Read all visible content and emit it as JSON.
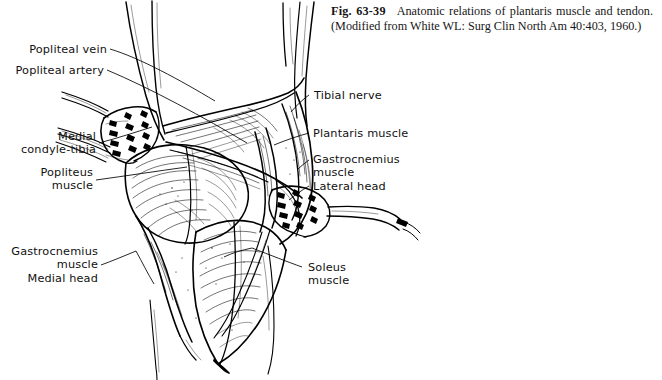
{
  "figure": {
    "number": "Fig. 63-39",
    "caption_text": "Anatomic relations of plantaris muscle and tendon. (Modified from White WL: Surg Clin North Am 40:403, 1960.)"
  },
  "labels": {
    "popliteal_vein": "Popliteal vein",
    "popliteal_artery": "Popliteal artery",
    "medial_condyle_tibia": "Medial\ncondyle-tibia",
    "popliteus_muscle": "Popliteus\nmuscle",
    "gastrocnemius_medial_head": "Gastrocnemius\nmuscle\nMedial head",
    "tibial_nerve": "Tibial nerve",
    "plantaris_muscle": "Plantaris muscle",
    "gastrocnemius_lateral_head": "Gastrocnemius\nmuscle\nLateral head",
    "soleus_muscle": "Soleus\nmuscle"
  },
  "colors": {
    "ink": "#000000",
    "background": "#ffffff",
    "caption_text": "#161616"
  }
}
